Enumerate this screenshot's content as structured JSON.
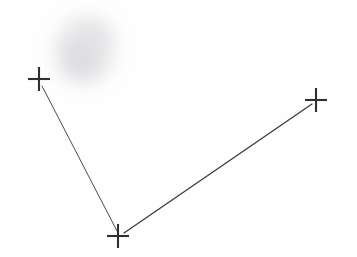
{
  "canvas": {
    "width": 357,
    "height": 257,
    "background_color": "#fefefe"
  },
  "figure": {
    "stroke_color": "#3a3a3e",
    "marker_color": "#2f2f33",
    "smudge_color": "#d8d8dc"
  },
  "chart_data": {
    "type": "scatter",
    "title": "",
    "xlabel": "",
    "ylabel": "",
    "xlim": [
      0,
      357
    ],
    "ylim": [
      0,
      257
    ],
    "grid": false,
    "legend": "none",
    "points": [
      {
        "name": "left-vertex",
        "label": "",
        "x": 39,
        "y": 79,
        "marker": "plus"
      },
      {
        "name": "bottom-vertex",
        "label": "",
        "x": 118,
        "y": 236,
        "marker": "plus"
      },
      {
        "name": "right-vertex",
        "label": "",
        "x": 316,
        "y": 100,
        "marker": "plus"
      }
    ],
    "segments": [
      {
        "name": "left-arm",
        "from": "left-vertex",
        "to": "bottom-vertex",
        "x1": 42,
        "y1": 86,
        "x2": 117,
        "y2": 231,
        "width": 1.0,
        "color": "#4a4a50"
      },
      {
        "name": "right-arm",
        "from": "bottom-vertex",
        "to": "right-vertex",
        "x1": 124,
        "y1": 233,
        "x2": 312,
        "y2": 104,
        "width": 1.3,
        "color": "#3a3a3e"
      }
    ],
    "marker_geometry": {
      "arm_half_width": 11,
      "arm_half_height": 12,
      "stroke_width": 2.1
    },
    "annotations": [
      {
        "name": "graphite-smudge",
        "cx": 85,
        "cy": 50,
        "rx": 30,
        "ry": 34,
        "opacity": 0.55
      }
    ]
  }
}
